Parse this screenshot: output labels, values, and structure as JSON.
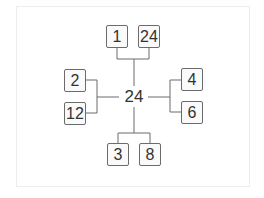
{
  "diagram": {
    "center": "24",
    "pairs": [
      {
        "position": "top",
        "factors": [
          "1",
          "24"
        ]
      },
      {
        "position": "left",
        "factors": [
          "2",
          "12"
        ]
      },
      {
        "position": "right",
        "factors": [
          "4",
          "6"
        ]
      },
      {
        "position": "bottom",
        "factors": [
          "3",
          "8"
        ]
      }
    ],
    "colors": {
      "line": "#6b6b6b",
      "text": "#333333",
      "box_fill": "#fafafa"
    }
  }
}
